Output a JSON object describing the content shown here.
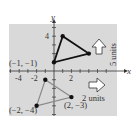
{
  "diagram": {
    "type": "coordinate-translation",
    "axis_labels": {
      "x": "x",
      "y": "y"
    },
    "x_ticks": [
      {
        "value": -4,
        "label": "-4"
      },
      {
        "value": -2,
        "label": "-2"
      },
      {
        "value": 2,
        "label": "2"
      }
    ],
    "y_ticks": [
      {
        "value": 4,
        "label": "4"
      }
    ],
    "range": {
      "xmin": -5,
      "xmax": 6,
      "ymin": -5,
      "ymax": 5
    },
    "original_triangle": {
      "color": "#8a8a8a",
      "vertices": [
        [
          -1,
          -1
        ],
        [
          -2,
          -4
        ],
        [
          2,
          -3
        ]
      ]
    },
    "translated_triangle": {
      "color": "#111111",
      "vertices": [
        [
          1,
          4
        ],
        [
          0,
          1
        ],
        [
          4,
          2
        ]
      ]
    },
    "point_labels": [
      {
        "text": "(−1, −1)",
        "x": -1,
        "y": -1
      },
      {
        "text": "(−2, −4)",
        "x": -2,
        "y": -4
      },
      {
        "text": "(2, −3)",
        "x": 2,
        "y": -3
      }
    ],
    "translations": [
      {
        "direction": "right",
        "label": "2 units"
      },
      {
        "direction": "up",
        "label": "5 units"
      }
    ],
    "background_color": "#d9d9d9"
  }
}
